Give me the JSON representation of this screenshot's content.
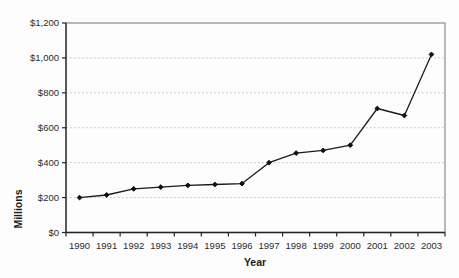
{
  "chart_data": {
    "type": "line",
    "title": "",
    "xlabel": "Year",
    "ylabel": "Millions",
    "categories": [
      "1990",
      "1991",
      "1992",
      "1993",
      "1994",
      "1995",
      "1996",
      "1997",
      "1998",
      "1999",
      "2000",
      "2001",
      "2002",
      "2003"
    ],
    "values": [
      200,
      215,
      250,
      260,
      270,
      275,
      280,
      400,
      455,
      470,
      500,
      710,
      670,
      1020
    ],
    "ylim": [
      0,
      1200
    ],
    "ytick_interval": 200,
    "ytick_labels": [
      "$0",
      "$200",
      "$400",
      "$600",
      "$800",
      "$1,000",
      "$1,200"
    ],
    "grid": "horizontal-dotted",
    "legend": "none",
    "marker": "diamond",
    "colors": {
      "line": "#1a1a1a",
      "marker": "#111111",
      "grid": "#bdbdbd",
      "plot_border": "#8c8c8c",
      "axis": "#262626",
      "tick_text": "#2b2b2b",
      "background": "#fdfdfd"
    }
  }
}
